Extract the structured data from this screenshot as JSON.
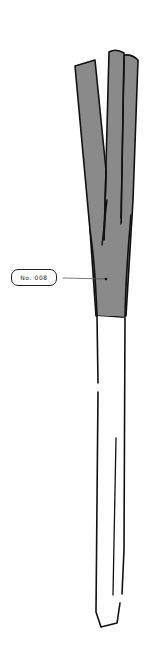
{
  "figure": {
    "label": "No. 008",
    "colors": {
      "leaf_fill": "#8a8a8a",
      "stalk_fill": "#ffffff",
      "outline": "#111111",
      "leader_line": "#555555"
    }
  }
}
